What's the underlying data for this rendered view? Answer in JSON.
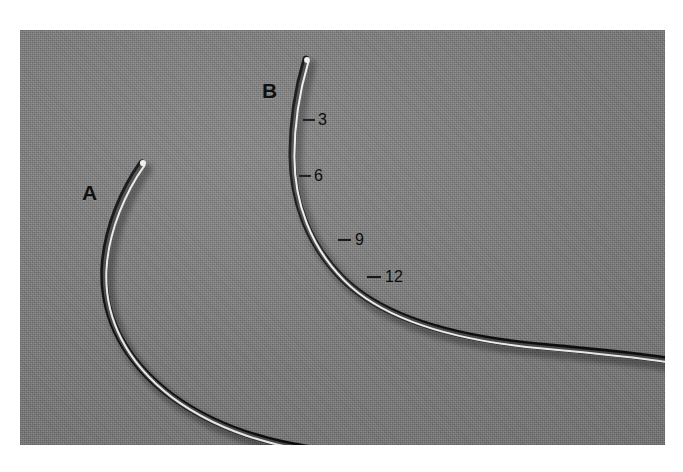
{
  "figure": {
    "background_color": "#ffffff",
    "photo": {
      "backdrop_color": "#7b7b7b",
      "left": 20,
      "top": 30,
      "width": 645,
      "height": 415
    },
    "specimen_labels": [
      {
        "id": "A",
        "text": "A",
        "x": 62,
        "y": 152
      },
      {
        "id": "B",
        "text": "B",
        "x": 242,
        "y": 50
      }
    ],
    "scale_ticks": [
      {
        "text": "3",
        "label_x": 298,
        "label_y": 82,
        "tick_x1": 283,
        "tick_y1": 90,
        "tick_x2": 295,
        "tick_y2": 90
      },
      {
        "text": "6",
        "label_x": 294,
        "label_y": 138,
        "tick_x1": 279,
        "tick_y1": 146,
        "tick_x2": 291,
        "tick_y2": 146
      },
      {
        "text": "9",
        "label_x": 335,
        "label_y": 202,
        "tick_x1": 318,
        "tick_y1": 210,
        "tick_x2": 331,
        "tick_y2": 210
      },
      {
        "text": "12",
        "label_x": 365,
        "label_y": 239,
        "tick_x1": 347,
        "tick_y1": 247,
        "tick_x2": 361,
        "tick_y2": 247
      }
    ],
    "wires": [
      {
        "id": "wire-a",
        "label": "A",
        "description": "slender curved metallic wire, tip at upper left curving down and sweeping right off the bottom edge",
        "tip_x": 122,
        "tip_y": 133,
        "path": "M 122 133 C 104 158, 86 198, 84 238 C 82 286, 104 330, 150 365 C 200 402, 268 420, 340 424",
        "highlight_color": "#f2f2ee",
        "shadow_color": "#0d0d0d",
        "body_color": "#3c3c3c"
      },
      {
        "id": "wire-b",
        "label": "B",
        "description": "slender curved metallic wire with scale tick marks, tip at top curving down and sweeping right off the right edge",
        "tip_x": 286,
        "tip_y": 29,
        "path": "M 286 29 C 278 56, 272 92, 272 124 C 272 170, 288 214, 322 248 C 362 288, 432 308, 520 316 C 575 321, 622 326, 648 330",
        "highlight_color": "#f4f4f0",
        "shadow_color": "#0b0b0b",
        "body_color": "#3a3a3a"
      }
    ]
  }
}
